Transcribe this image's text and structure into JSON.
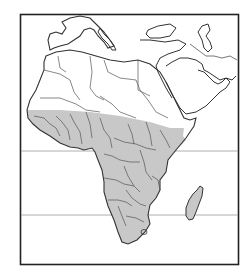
{
  "map": {
    "subject": "Africa and the Middle East",
    "shaded_region": "Sub-Saharan Africa",
    "colors": {
      "background": "#ffffff",
      "shade": "#c8c8c8",
      "border": "#333333",
      "frame": "#222222",
      "reference_line": "#999999"
    },
    "reference_lines": [
      {
        "name": "equator",
        "y": 151
      },
      {
        "name": "tropic-of-capricorn",
        "y": 215
      }
    ]
  }
}
